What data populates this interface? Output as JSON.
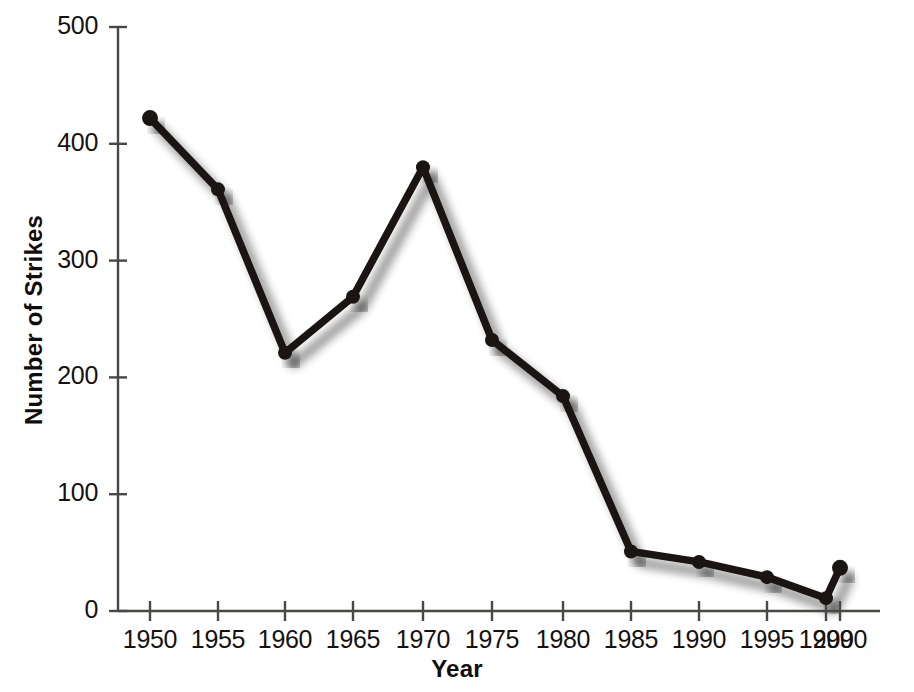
{
  "chart_data": {
    "type": "line",
    "title": "",
    "xlabel": "Year",
    "ylabel": "Number of Strikes",
    "x": [
      1950,
      1955,
      1960,
      1965,
      1970,
      1975,
      1980,
      1985,
      1990,
      1995,
      1999,
      2000
    ],
    "values": [
      422,
      361,
      221,
      269,
      380,
      232,
      184,
      51,
      42,
      29,
      11,
      37
    ],
    "series": [
      {
        "name": "Number of Strikes",
        "values": [
          422,
          361,
          221,
          269,
          380,
          232,
          184,
          51,
          42,
          29,
          11,
          37
        ]
      }
    ],
    "xtick_labels": [
      "1950",
      "1955",
      "1960",
      "1965",
      "1970",
      "1975",
      "1980",
      "1985",
      "1990",
      "1995",
      "1999",
      "2000"
    ],
    "xtick_positions": [
      1950,
      1955,
      1960,
      1965,
      1970,
      1975,
      1980,
      1985,
      1990,
      1995,
      1999,
      2000
    ],
    "ytick_labels": [
      "0",
      "100",
      "200",
      "300",
      "400",
      "500"
    ],
    "ytick_values": [
      0,
      100,
      200,
      300,
      400,
      500
    ],
    "ylim": [
      0,
      500
    ],
    "xlim": [
      1950,
      2000
    ],
    "grid": false,
    "legend": false,
    "marker": "circle",
    "line_color": "#1a1513",
    "marker_color": "#1a1513",
    "shadow_color": "#b9b5b2",
    "axis_color": "#4a4745",
    "background_color": "#ffffff",
    "note_nonuniform_axis": "1999 and 2000 ticks are spaced closer than the 5-year intervals"
  }
}
